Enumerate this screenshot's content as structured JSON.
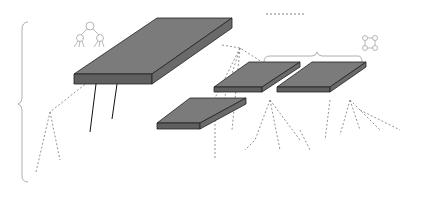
{
  "legend": {
    "route_label": "Multi-casting route"
  },
  "topologies": {
    "hstar_line1": "H-star",
    "hstar_line2": "topology",
    "ring": "Ring topology"
  },
  "switches": {
    "system": {
      "size": "9 × 10",
      "name": "System Switch"
    },
    "local_left": {
      "size": "7 × 7",
      "name": "Local Switch"
    },
    "local_right": {
      "size": "7 × 7",
      "name": "Local Switch"
    }
  },
  "ips": {
    "exts": "2 EXTs",
    "dp": "DP",
    "stm": "STM",
    "npe": "NPE",
    "group_line1": "Multi-casting",
    "group_line2": "IPs"
  },
  "spus": {
    "label": "16 SPUs",
    "count": 16
  },
  "colors": {
    "switch_top": "#7b7b7b",
    "switch_side": "#5f5f5f",
    "tile_top": "#d6d6d6",
    "tile_side": "#9a9a9a",
    "annotation_gray": "#8a8a8a",
    "route_dash": "#777777"
  }
}
